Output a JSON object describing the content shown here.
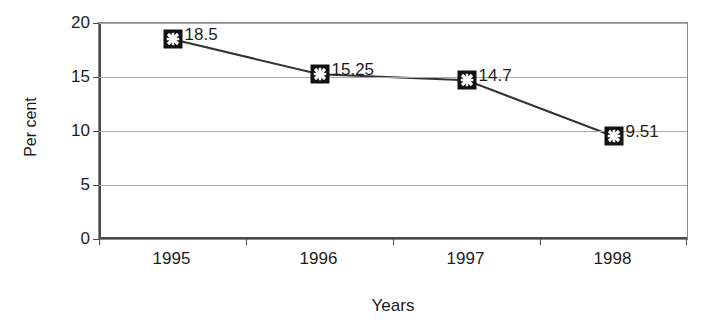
{
  "chart_data": {
    "type": "line",
    "title": "",
    "subtitle": "",
    "xlabel": "Years",
    "ylabel": "Per cent",
    "categories": [
      "1995",
      "1996",
      "1997",
      "1998"
    ],
    "values": [
      18.5,
      15.25,
      14.7,
      9.51
    ],
    "point_labels": [
      "18.5",
      "15.25",
      "14.7",
      "9.51"
    ],
    "series": [
      {
        "name": "",
        "values": [
          18.5,
          15.25,
          14.7,
          9.51
        ]
      }
    ],
    "ylim": [
      0,
      20
    ],
    "ytick_values": [
      0,
      5,
      10,
      15,
      20
    ],
    "ytick_labels": [
      "0",
      "5",
      "10",
      "15",
      "20"
    ],
    "grid": true,
    "grid_axis": "y",
    "legend": false,
    "legend_position": "none",
    "marker_style": "black-square-with-white-x",
    "line_color": "#333333",
    "marker_fill": "#111111",
    "marker_glyph_color": "#ffffff",
    "grid_color": "#a9a9a9",
    "axis_color": "#4a4a4a",
    "background": "#ffffff"
  },
  "axes": {
    "y_title": "Per cent",
    "x_title": "Years"
  }
}
